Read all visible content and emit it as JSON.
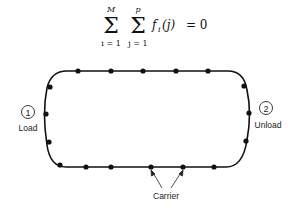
{
  "equation": {
    "outer_sum_upper": "M",
    "outer_sum_lower": "i = 1",
    "inner_sum_upper": "p",
    "inner_sum_lower": "j = 1",
    "term": "f",
    "subscript": "i",
    "argument": "(j)",
    "rhs": "= 0"
  },
  "stations": [
    {
      "number": "1",
      "label": "Load"
    },
    {
      "number": "2",
      "label": "Unload"
    }
  ],
  "carrier_label": "Carrier",
  "colors": {
    "line": "#111111",
    "background": "#ffffff"
  }
}
